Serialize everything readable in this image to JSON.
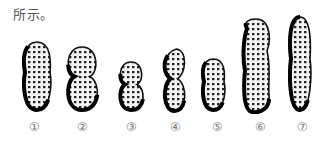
{
  "caption": "所示。",
  "figure": {
    "labels": [
      "①",
      "②",
      "③",
      "④",
      "⑤",
      "⑥",
      "⑦"
    ],
    "pods": [
      {
        "id": 1,
        "shape": "long-two-seed",
        "x": 22,
        "y": 40,
        "w": 30,
        "h": 72
      },
      {
        "id": 2,
        "shape": "bulbous-two-seed",
        "x": 63,
        "y": 45,
        "w": 38,
        "h": 67
      },
      {
        "id": 3,
        "shape": "small-round-two-seed",
        "x": 116,
        "y": 60,
        "w": 30,
        "h": 52
      },
      {
        "id": 4,
        "shape": "constricted-beaked",
        "x": 161,
        "y": 47,
        "w": 27,
        "h": 66
      },
      {
        "id": 5,
        "shape": "short-cylindrical",
        "x": 201,
        "y": 57,
        "w": 25,
        "h": 55
      },
      {
        "id": 6,
        "shape": "long-beaked-multi-seed",
        "x": 241,
        "y": 17,
        "w": 30,
        "h": 97
      },
      {
        "id": 7,
        "shape": "long-cylindrical",
        "x": 288,
        "y": 15,
        "w": 24,
        "h": 97
      }
    ]
  }
}
